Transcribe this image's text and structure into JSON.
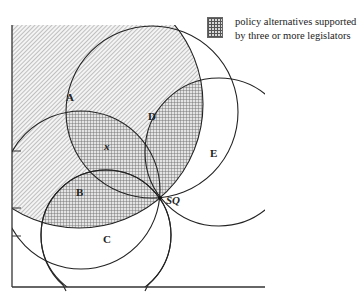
{
  "legend": {
    "label": "policy alternatives supported by three or more legislators",
    "swatch_pattern": "crosshatch-grid"
  },
  "labels": {
    "A": "A",
    "B": "B",
    "C": "C",
    "D": "D",
    "E": "E",
    "x": "x",
    "SQ": "SQ"
  },
  "colors": {
    "stroke": "#222222",
    "hatch": "#9a9a9a",
    "grid": "#777777"
  },
  "circles": [
    {
      "name": "A",
      "cx": 79,
      "cy": 104,
      "r": 124
    },
    {
      "name": "B",
      "cx": 81,
      "cy": 190,
      "r": 79
    },
    {
      "name": "C",
      "cx": 106,
      "cy": 235,
      "r": 65
    },
    {
      "name": "D",
      "cx": 152,
      "cy": 112,
      "r": 86
    },
    {
      "name": "E",
      "cx": 219,
      "cy": 152,
      "r": 74
    }
  ],
  "status_quo": {
    "x": 160,
    "y": 198
  }
}
